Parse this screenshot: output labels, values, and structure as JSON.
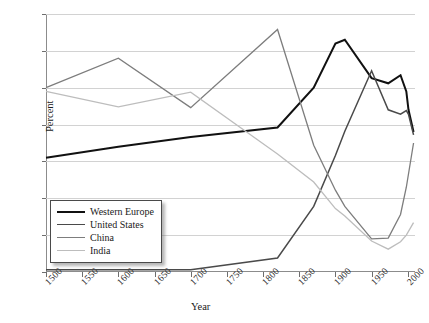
{
  "chart_data": {
    "type": "line",
    "title": "",
    "xlabel": "Year",
    "ylabel": "Percent",
    "xlim": [
      1500,
      2010
    ],
    "ylim": [
      0,
      35
    ],
    "grid": true,
    "legend_position": "bottom-left",
    "x_ticks": [
      "1500",
      "1550",
      "1600",
      "1650",
      "1700",
      "1750",
      "1800",
      "1850",
      "1900",
      "1950",
      "2000"
    ],
    "x_tick_values": [
      1500,
      1550,
      1600,
      1650,
      1700,
      1750,
      1800,
      1850,
      1900,
      1950,
      2000
    ],
    "y_ticks": [
      "0",
      "5",
      "10",
      "15",
      "20",
      "25",
      "30",
      "35"
    ],
    "y_tick_values": [
      0,
      5,
      10,
      15,
      20,
      25,
      30,
      35
    ],
    "series": [
      {
        "name": "Western Europe",
        "color": "#111111",
        "width": 2.0,
        "x": [
          1500,
          1600,
          1700,
          1820,
          1870,
          1900,
          1913,
          1950,
          1973,
          1990,
          1998,
          2001,
          2008
        ],
        "values": [
          15.5,
          17.0,
          18.3,
          19.6,
          25.0,
          31.0,
          31.5,
          26.3,
          25.6,
          26.7,
          24.5,
          22.0,
          19.0
        ]
      },
      {
        "name": "United States",
        "color": "#4a4a4a",
        "width": 1.5,
        "x": [
          1500,
          1600,
          1700,
          1820,
          1870,
          1900,
          1913,
          1950,
          1973,
          1990,
          1998,
          2001,
          2008
        ],
        "values": [
          0.3,
          0.3,
          0.3,
          1.9,
          8.9,
          15.8,
          19.1,
          27.3,
          22.0,
          21.4,
          21.9,
          21.4,
          18.6
        ]
      },
      {
        "name": "China",
        "color": "#7d7d7d",
        "width": 1.3,
        "x": [
          1500,
          1600,
          1700,
          1820,
          1870,
          1900,
          1913,
          1950,
          1973,
          1990,
          1998,
          2008
        ],
        "values": [
          25.0,
          29.0,
          22.3,
          32.9,
          17.2,
          11.1,
          8.9,
          4.5,
          4.6,
          7.8,
          11.5,
          17.5
        ]
      },
      {
        "name": "India",
        "color": "#bdbdbd",
        "width": 1.3,
        "x": [
          1500,
          1600,
          1700,
          1820,
          1870,
          1900,
          1913,
          1950,
          1973,
          1990,
          1998,
          2008
        ],
        "values": [
          24.5,
          22.4,
          24.4,
          16.0,
          12.2,
          8.6,
          7.6,
          4.2,
          3.1,
          4.1,
          5.0,
          6.7
        ]
      }
    ]
  },
  "legend": {
    "items": [
      {
        "label": "Western Europe"
      },
      {
        "label": "United States"
      },
      {
        "label": "China"
      },
      {
        "label": "India"
      }
    ]
  }
}
